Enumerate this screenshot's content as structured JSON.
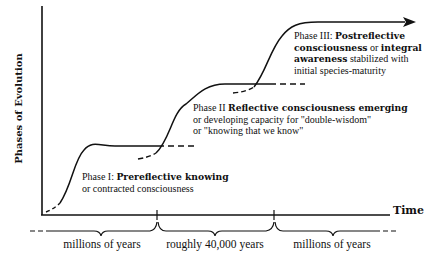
{
  "axes": {
    "ylabel": "Phases of Evolution",
    "xlabel": "Time"
  },
  "phases": [
    {
      "prefix": "Phase I: ",
      "bold": "Prereflective knowing",
      "rest": "",
      "line2": "or contracted consciousness",
      "line3": ""
    },
    {
      "prefix": "Phase II  ",
      "bold": "Reflective consciousness emerging",
      "rest": "",
      "line2": "or developing capacity for \"double-wisdom\"",
      "line3": "or \"knowing that we know\""
    },
    {
      "prefix": "Phase III: ",
      "bold": "Postreflective",
      "line2_bold1": "consciousness",
      "line2_mid": " or ",
      "line2_bold2": "integral",
      "line3_bold": "awareness",
      "line3_rest": " stabilized with",
      "line4": "initial species-maturity"
    }
  ],
  "time_spans": [
    {
      "label": "millions of years"
    },
    {
      "label": "roughly 40,000 years"
    },
    {
      "label": "millions of years"
    }
  ],
  "colors": {
    "ink": "#111111",
    "background": "#ffffff"
  }
}
